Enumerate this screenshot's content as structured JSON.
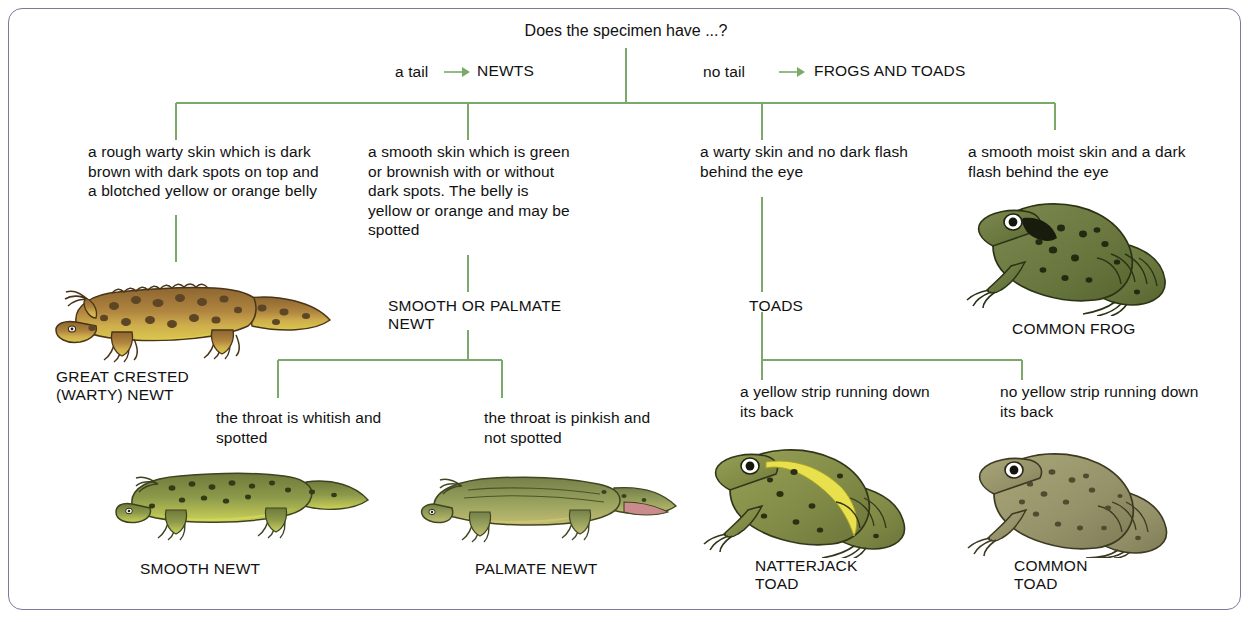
{
  "diagram": {
    "title": "Does the specimen have  ...?",
    "type": "dichotomous-identification-key",
    "border_color": "#7b7a9c",
    "connector_color": "#7aa96a",
    "branches": {
      "left_label": "a tail",
      "left_target": "NEWTS",
      "right_label": "no tail",
      "right_target": "FROGS AND TOADS",
      "arrow": "→"
    },
    "level1": [
      {
        "id": "great-crested",
        "description": "a rough warty skin which is dark brown with dark spots on top and a blotched yellow or orange belly",
        "result": "GREAT CRESTED\n(WARTY) NEWT",
        "result_line1": "GREAT CRESTED",
        "result_line2": "(WARTY) NEWT"
      },
      {
        "id": "smooth-or-palmate",
        "description": "a smooth skin which is green or brownish with or without dark spots. The belly is yellow or orange and may be spotted",
        "result_line1": "SMOOTH OR PALMATE",
        "result_line2": "NEWT"
      },
      {
        "id": "toads",
        "description": "a warty skin and no dark flash behind the eye",
        "result_line1": "TOADS",
        "result_line2": ""
      },
      {
        "id": "common-frog",
        "description": "a smooth moist skin and a dark flash behind the eye",
        "result_line1": "COMMON FROG",
        "result_line2": ""
      }
    ],
    "level2": [
      {
        "id": "smooth-newt",
        "description": "the  throat is whitish and spotted",
        "result_line1": "SMOOTH NEWT",
        "result_line2": ""
      },
      {
        "id": "palmate-newt",
        "description": "the  throat is pinkish and not spotted",
        "result_line1": "PALMATE  NEWT",
        "result_line2": ""
      },
      {
        "id": "natterjack-toad",
        "description": "a yellow strip running down its back",
        "result_line1": "NATTERJACK",
        "result_line2": "TOAD"
      },
      {
        "id": "common-toad",
        "description": "no yellow strip running down its back",
        "result_line1": "COMMON",
        "result_line2": "TOAD"
      }
    ],
    "illustrations": [
      {
        "name": "great-crested-newt-illustration",
        "colors": {
          "body": "#a97d3f",
          "belly": "#d8c64a",
          "spots": "#5a4526"
        }
      },
      {
        "name": "common-frog-illustration",
        "colors": {
          "body": "#6c7a48",
          "spots": "#2c3318",
          "eye": "#ffffff"
        }
      },
      {
        "name": "smooth-newt-illustration",
        "colors": {
          "body": "#8d9a4e",
          "belly": "#c9cf5e",
          "spots": "#3b3f1e"
        }
      },
      {
        "name": "palmate-newt-illustration",
        "colors": {
          "body": "#97a05a",
          "belly": "#c3c06a",
          "spots": "#41451f"
        }
      },
      {
        "name": "natterjack-toad-illustration",
        "colors": {
          "body": "#8a9150",
          "stripe": "#e4e04a",
          "spots": "#3a3d1c"
        }
      },
      {
        "name": "common-toad-illustration",
        "colors": {
          "body": "#9a9a6c",
          "spots": "#4a4730",
          "eye": "#ffffff"
        }
      }
    ]
  }
}
